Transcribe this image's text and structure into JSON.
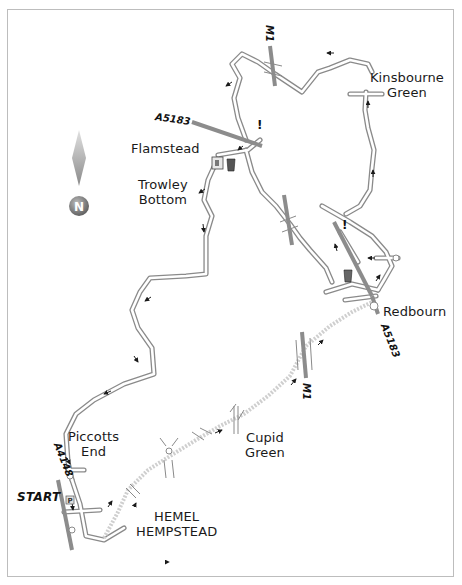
{
  "map": {
    "title": "Walk route map: Piccotts End – Flamstead – Kinsbourne Green – Redbourn – Cupid Green",
    "colors": {
      "frame": "#bdbdbd",
      "road_fill": "#ffffff",
      "road_edge": "#8a8a8a",
      "major_road": "#8c8c8c",
      "dotted_path": "#c8c8c8",
      "arrow": "#1a1a1a",
      "compass_gradient_top": "#d0d0d0",
      "compass_gradient_bottom": "#6e6e6e"
    },
    "compass": {
      "letter": "N",
      "icon": "north-arrow-icon"
    },
    "places": [
      {
        "id": "kinsbourne-green",
        "lines": [
          "Kinsbourne",
          "Green"
        ],
        "x": 386,
        "y": 70
      },
      {
        "id": "flamstead",
        "lines": [
          "Flamstead"
        ],
        "x": 131,
        "y": 141
      },
      {
        "id": "trowley-bottom",
        "lines": [
          "Trowley",
          "Bottom"
        ],
        "x": 138,
        "y": 176
      },
      {
        "id": "redbourn",
        "lines": [
          "Redbourn"
        ],
        "x": 383,
        "y": 304
      },
      {
        "id": "piccotts-end",
        "lines": [
          "Piccotts",
          "End"
        ],
        "x": 69,
        "y": 429
      },
      {
        "id": "cupid-green",
        "lines": [
          "Cupid",
          "Green"
        ],
        "x": 245,
        "y": 430
      },
      {
        "id": "hemel-hempstead",
        "lines": [
          "HEMEL",
          "HEMPSTEAD"
        ],
        "x": 136,
        "y": 509
      }
    ],
    "road_labels": [
      {
        "id": "a5183-north",
        "text": "A5183",
        "x": 156,
        "y": 113,
        "rotate": 8
      },
      {
        "id": "a5183-redbourn",
        "text": "A5183",
        "x": 385,
        "y": 322,
        "rotate": 68
      },
      {
        "id": "a4148",
        "text": "A4148",
        "x": 56,
        "y": 443,
        "rotate": 68
      },
      {
        "id": "m1-north",
        "text": "M1",
        "x": 272,
        "y": 30,
        "rotate": 90
      },
      {
        "id": "m1-south",
        "text": "M1",
        "x": 309,
        "y": 379,
        "rotate": 90
      }
    ],
    "start": {
      "text": "START",
      "x": 17,
      "y": 493
    },
    "warnings": [
      {
        "id": "warning-a5183-flamstead",
        "text": "!",
        "x": 257,
        "y": 125
      },
      {
        "id": "warning-a5183-redbourn",
        "text": "!",
        "x": 342,
        "y": 218
      }
    ],
    "icons": [
      {
        "id": "pub-flamstead",
        "type": "pub-icon",
        "x": 230,
        "y": 160
      },
      {
        "id": "church-flamstead",
        "type": "church-icon",
        "x": 216,
        "y": 160
      },
      {
        "id": "pub-redbourn",
        "type": "pub-icon",
        "x": 347,
        "y": 272
      },
      {
        "id": "parking-start",
        "type": "parking-icon",
        "x": 69,
        "y": 497
      }
    ]
  }
}
